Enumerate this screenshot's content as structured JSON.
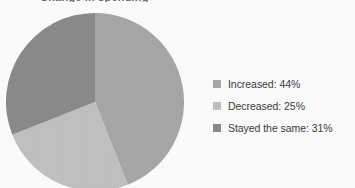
{
  "figure": {
    "background_color": "#ffffff",
    "title_fragment": "Change in spending",
    "title_visible": false
  },
  "chart_data": {
    "type": "pie",
    "title": "",
    "xlabel": "",
    "ylabel": "",
    "grid": false,
    "legend_position": "right",
    "start_angle_deg": 0,
    "direction": "clockwise",
    "categories": [
      "Increased",
      "Decreased",
      "Stayed the same"
    ],
    "values": [
      44,
      25,
      31
    ],
    "unit": "%",
    "colors": [
      "#a9a9a9",
      "#c3c3c3",
      "#8c8c8c"
    ],
    "slices": [
      {
        "label": "Increased",
        "value": 44,
        "display": "Increased: 44%",
        "color": "#a9a9a9",
        "start_deg": 0,
        "end_deg": 158.4
      },
      {
        "label": "Decreased",
        "value": 25,
        "display": "Decreased: 25%",
        "color": "#c3c3c3",
        "start_deg": 158.4,
        "end_deg": 248.4
      },
      {
        "label": "Stayed the same",
        "value": 31,
        "display": "Stayed the same: 31%",
        "color": "#8c8c8c",
        "start_deg": 248.4,
        "end_deg": 360
      }
    ]
  },
  "legend": {
    "items": [
      {
        "label": "Increased: 44%",
        "color": "#a9a9a9"
      },
      {
        "label": "Decreased: 25%",
        "color": "#c3c3c3"
      },
      {
        "label": "Stayed the same: 31%",
        "color": "#8c8c8c"
      }
    ]
  }
}
